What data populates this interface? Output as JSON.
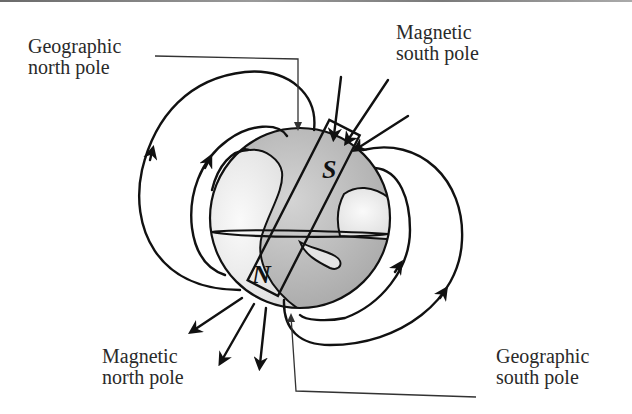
{
  "diagram": {
    "labels": {
      "geographic_north": {
        "line1": "Geographic",
        "line2": "north pole"
      },
      "magnetic_south": {
        "line1": "Magnetic",
        "line2": "south pole"
      },
      "magnetic_north": {
        "line1": "Magnetic",
        "line2": "north pole"
      },
      "geographic_south": {
        "line1": "Geographic",
        "line2": "south pole"
      }
    },
    "magnet": {
      "top_pole": "S",
      "bottom_pole": "N"
    },
    "colors": {
      "line": "#111111",
      "globe_fill": "#bdbdbd",
      "land_fill": "#f0f0f0",
      "text": "#2a2a2a"
    }
  }
}
